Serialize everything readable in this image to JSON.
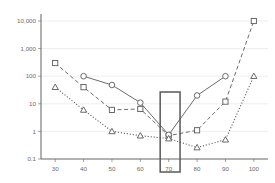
{
  "chart_data": {
    "type": "line",
    "title": "",
    "subtitle": "",
    "xlabel": "",
    "ylabel": "",
    "yscale": "log",
    "xscale": "linear",
    "grid": true,
    "legend": "none",
    "xlim": [
      25,
      105
    ],
    "ylim": [
      0.1,
      10000
    ],
    "x_ticks": [
      30,
      40,
      50,
      60,
      70,
      80,
      90,
      100
    ],
    "x_tick_labels": [
      "30",
      "40",
      "50",
      "60",
      "70",
      "80",
      "90",
      "100"
    ],
    "y_ticks": [
      0.1,
      1,
      10,
      100,
      1000,
      10000
    ],
    "y_tick_labels": [
      "0.1",
      "1",
      "10",
      "100",
      "1,000",
      "10,000"
    ],
    "series": [
      {
        "name": "squares",
        "marker": "square",
        "linestyle": "dashed",
        "color": "#5a5a5a",
        "x": [
          30,
          40,
          50,
          60,
          70,
          80,
          90,
          100
        ],
        "values": [
          300,
          40,
          6,
          6.5,
          0.7,
          1.1,
          12,
          10000
        ]
      },
      {
        "name": "circles",
        "marker": "circle",
        "linestyle": "solid",
        "color": "#5a5a5a",
        "x": [
          40,
          50,
          60,
          70,
          80,
          90
        ],
        "values": [
          100,
          48,
          11,
          0.75,
          20,
          100
        ]
      },
      {
        "name": "triangles",
        "marker": "triangle",
        "linestyle": "dotted",
        "color": "#5a5a5a",
        "x": [
          30,
          40,
          50,
          60,
          70,
          80,
          90,
          100
        ],
        "values": [
          40,
          6,
          1,
          0.7,
          0.55,
          0.26,
          0.5,
          100
        ]
      }
    ],
    "annotations": [
      {
        "name": "highlight-box",
        "type": "rect",
        "x_range": [
          67,
          74
        ],
        "description": "rectangle highlighting the x = 70 column"
      }
    ]
  }
}
